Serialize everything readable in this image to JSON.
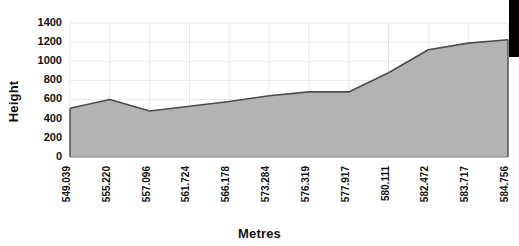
{
  "chart_data": {
    "type": "area",
    "title": "",
    "xlabel": "Metres",
    "ylabel": "Height",
    "categories": [
      "549.039",
      "555.220",
      "557.096",
      "561.724",
      "566.178",
      "573.284",
      "576.319",
      "577.917",
      "580.111",
      "582.472",
      "583.717",
      "584.756"
    ],
    "values": [
      510,
      600,
      480,
      530,
      580,
      640,
      680,
      680,
      880,
      1120,
      1190,
      1225
    ],
    "ylim": [
      0,
      1400
    ],
    "y_ticks": [
      0,
      200,
      400,
      600,
      800,
      1000,
      1200,
      1400
    ],
    "y_tick_labels": [
      "0",
      "200",
      "400",
      "600",
      "800",
      "1000",
      "1200",
      "1400"
    ],
    "grid": true,
    "grid_vertical": true,
    "grid_horizontal": true,
    "legend": false,
    "series": [
      {
        "name": "Height",
        "values": [
          510,
          600,
          480,
          530,
          580,
          640,
          680,
          680,
          880,
          1120,
          1190,
          1225
        ],
        "fill_color": "#b3b3b3",
        "line_color": "#4d4d4d"
      }
    ],
    "colors": {
      "area_fill": "#b3b3b3",
      "area_line": "#4d4d4d",
      "axis": "#808080",
      "grid": "#e8e8e8",
      "text": "#111111",
      "background": "#ffffff",
      "artifact": "#000000"
    }
  },
  "axes": {
    "y_title": "Height",
    "x_title": "Metres"
  }
}
